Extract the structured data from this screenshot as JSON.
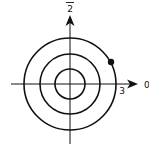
{
  "diagram": {
    "type": "polar-coordinate-grid",
    "labels": {
      "top_axis": "2",
      "top_axis_overline": true,
      "right_axis": "0",
      "radius_tick": "3"
    },
    "circles": [
      {
        "name": "inner",
        "radius": 1
      },
      {
        "name": "middle",
        "radius": 2
      },
      {
        "name": "outer",
        "radius": 3
      }
    ],
    "point": {
      "r": 3,
      "note": "point on outer circle in first quadrant"
    },
    "colors": {
      "stroke": "#111111",
      "background": "#ffffff"
    }
  }
}
